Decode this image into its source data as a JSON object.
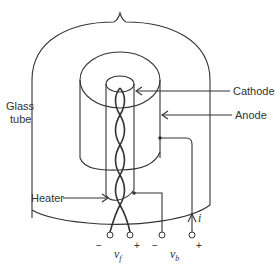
{
  "diagram": {
    "type": "vacuum-tube-diode-cross-section",
    "labels": {
      "glass_tube_line1": "Glass",
      "glass_tube_line2": "tube",
      "cathode": "Cathode",
      "anode": "Anode",
      "heater": "Heater",
      "current": "i",
      "vf": "v",
      "vf_sub": "f",
      "vb": "v",
      "vb_sub": "b"
    },
    "terminals": [
      {
        "id": "heater-minus",
        "sign": "−"
      },
      {
        "id": "heater-plus",
        "sign": "+"
      },
      {
        "id": "cathode-minus",
        "sign": "−"
      },
      {
        "id": "anode-plus",
        "sign": "+"
      }
    ],
    "colors": {
      "stroke": "#333333",
      "background": "#ffffff"
    }
  }
}
